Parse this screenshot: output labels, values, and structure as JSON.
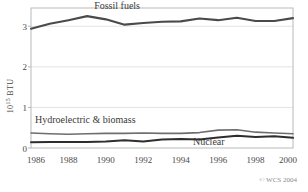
{
  "chart_data": {
    "type": "line",
    "title": "",
    "xlabel": "",
    "ylabel": "10^15 BTU",
    "ylabel_mantissa": "10",
    "ylabel_exponent": "15",
    "ylabel_unit": "BTU",
    "x": [
      1986,
      1987,
      1988,
      1989,
      1990,
      1991,
      1992,
      1993,
      1994,
      1995,
      1996,
      1997,
      1998,
      1999,
      2000
    ],
    "xlim": [
      1986,
      2000
    ],
    "ylim": [
      0,
      3.45
    ],
    "xticks": [
      1986,
      1988,
      1990,
      1992,
      1994,
      1996,
      1998,
      2000
    ],
    "xtick_labels": [
      "1986",
      "1988",
      "1990",
      "1992",
      "1994",
      "1996",
      "1998",
      "2000"
    ],
    "yticks": [
      0,
      1,
      2,
      3
    ],
    "ytick_labels": [
      "0",
      "1",
      "2",
      "3"
    ],
    "grid": true,
    "legend_position": "inline-annotations",
    "series": [
      {
        "name": "Fossil fuels",
        "color": "#4a4a4a",
        "width": 2.1,
        "label_x": 1990.6,
        "label_y": 3.42,
        "values": [
          2.94,
          3.06,
          3.15,
          3.25,
          3.17,
          3.04,
          3.08,
          3.11,
          3.12,
          3.19,
          3.15,
          3.21,
          3.13,
          3.13,
          3.2
        ]
      },
      {
        "name": "Hydroelectric & biomass",
        "color": "#6e6e6e",
        "width": 1.6,
        "label_x": 1988.9,
        "label_y": 0.62,
        "values": [
          0.37,
          0.35,
          0.34,
          0.35,
          0.36,
          0.36,
          0.37,
          0.36,
          0.36,
          0.38,
          0.44,
          0.45,
          0.39,
          0.37,
          0.35
        ]
      },
      {
        "name": "Nuclear",
        "color": "#2e2e2e",
        "width": 2.0,
        "label_x": 1995.5,
        "label_y": 0.07,
        "values": [
          0.14,
          0.15,
          0.15,
          0.15,
          0.16,
          0.19,
          0.16,
          0.21,
          0.22,
          0.21,
          0.26,
          0.3,
          0.27,
          0.29,
          0.25
        ]
      }
    ],
    "copyright": "© WCS 2004"
  }
}
